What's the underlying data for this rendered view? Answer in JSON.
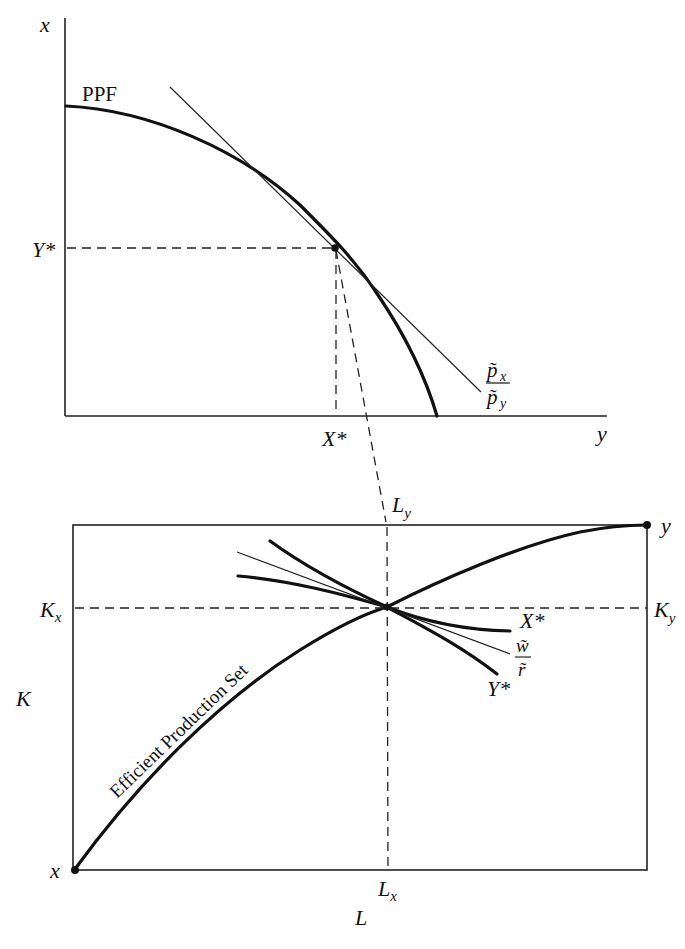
{
  "top_panel": {
    "axis_vertical_label": "x",
    "axis_horizontal_label": "y",
    "curve_label": "PPF",
    "y_star_label": "Y*",
    "x_star_label": "X*",
    "price_ratio": {
      "numerator": "p̃",
      "numerator_sub": "x",
      "denominator": "p̃",
      "denominator_sub": "y"
    }
  },
  "bottom_panel": {
    "origin_x_label": "x",
    "origin_y_label": "y",
    "k_label": "K",
    "l_label": "L",
    "kx_label": {
      "base": "K",
      "sub": "x"
    },
    "ky_label": {
      "base": "K",
      "sub": "y"
    },
    "lx_label": {
      "base": "L",
      "sub": "x"
    },
    "ly_label": {
      "base": "L",
      "sub": "y"
    },
    "curve_label": "Efficient Production Set",
    "isoquant_x_label": "X*",
    "isoquant_y_label": "Y*",
    "wage_ratio": {
      "numerator": "w̃",
      "denominator": "r̃"
    }
  }
}
